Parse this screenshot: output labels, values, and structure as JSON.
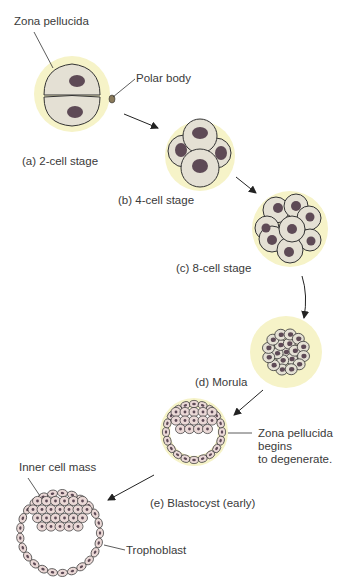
{
  "diagram": {
    "colors": {
      "zona": "#f6f3c8",
      "cell_fill": "#e4e0d4",
      "nucleus": "#5e4a56",
      "blastocyst_cell": "#ead8d6",
      "outline": "#333333",
      "text": "#3a3a3a"
    },
    "labels": {
      "zona_pellucida": "Zona pellucida",
      "polar_body": "Polar body",
      "stage_a": "(a) 2-cell stage",
      "stage_b": "(b) 4-cell stage",
      "stage_c": "(c) 8-cell stage",
      "stage_d": "(d) Morula",
      "zona_degenerate_1": "Zona pellucida",
      "zona_degenerate_2": "begins",
      "zona_degenerate_3": "to degenerate.",
      "stage_e": "(e) Blastocyst (early)",
      "inner_cell_mass": "Inner cell mass",
      "trophoblast": "Trophoblast"
    }
  }
}
